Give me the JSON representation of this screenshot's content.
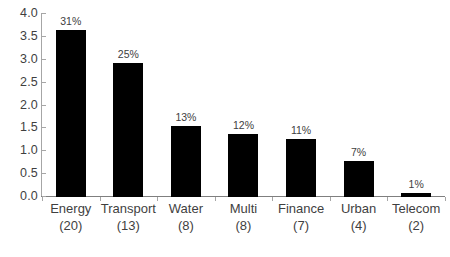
{
  "chart_data": {
    "type": "bar",
    "title": "",
    "subtitle": "",
    "xlabel": "",
    "ylabel": "",
    "categories": [
      "Energy",
      "Transport",
      "Water",
      "Multi",
      "Finance",
      "Urban",
      "Telecom"
    ],
    "category_counts": [
      "(20)",
      "(13)",
      "(8)",
      "(8)",
      "(7)",
      "(4)",
      "(2)"
    ],
    "values": [
      3.65,
      2.93,
      1.55,
      1.38,
      1.27,
      0.78,
      0.08
    ],
    "data_labels": [
      "31%",
      "25%",
      "13%",
      "12%",
      "11%",
      "7%",
      "1%"
    ],
    "ylim": [
      0.0,
      4.0
    ],
    "ytick_values": [
      4.0,
      3.5,
      3.0,
      2.5,
      2.0,
      1.5,
      1.0,
      0.5,
      0.0
    ],
    "ytick_labels": [
      "4.0",
      "3.5",
      "3.0",
      "2.5",
      "2.0",
      "1.5",
      "1.0",
      "0.5",
      "0.0"
    ],
    "grid": false,
    "legend": false,
    "legend_position": "none",
    "bar_color": "#000000",
    "axis_color": "#a6a6a6",
    "text_color": "#3f3f3f",
    "background_color": "#ffffff"
  }
}
